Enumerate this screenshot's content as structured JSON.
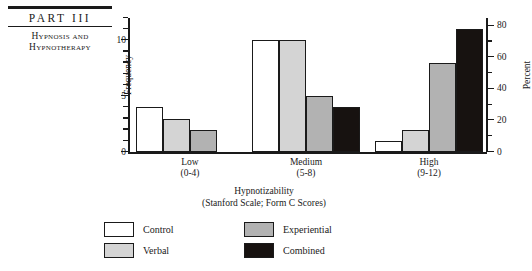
{
  "page_header": {
    "part_label": "PART III",
    "subtitle_line1": "Hypnosis and",
    "subtitle_line2": "Hypnotherapy"
  },
  "legend": {
    "items": [
      {
        "label": "Control",
        "color": "#ffffff"
      },
      {
        "label": "Experiential",
        "color": "#b2b2b2"
      },
      {
        "label": "Verbal",
        "color": "#d4d4d4"
      },
      {
        "label": "Combined",
        "color": "#171210"
      }
    ]
  },
  "chart_data": {
    "type": "bar",
    "title": "",
    "xlabel_line1": "Hypnotizability",
    "xlabel_line2": "(Stanford Scale; Form C Scores)",
    "ylabel": "Frequency",
    "ylabel_secondary": "Percent",
    "categories": [
      "Low",
      "Medium",
      "High"
    ],
    "category_sublabels": [
      "(0-4)",
      "(5-8)",
      "(9-12)"
    ],
    "series": [
      {
        "name": "Control",
        "color": "#ffffff",
        "values": [
          4,
          10,
          1
        ]
      },
      {
        "name": "Verbal",
        "color": "#d4d4d4",
        "values": [
          3,
          10,
          2
        ]
      },
      {
        "name": "Experiential",
        "color": "#b2b2b2",
        "values": [
          2,
          5,
          8
        ]
      },
      {
        "name": "Combined",
        "color": "#171210",
        "values": [
          0,
          4,
          11
        ]
      }
    ],
    "ylim": [
      0,
      12
    ],
    "yticks_major": [
      0,
      5,
      10
    ],
    "yticks_minor_step": 1,
    "ylim_secondary": [
      0,
      85
    ],
    "yticks_secondary_major": [
      0,
      20,
      40,
      60,
      80
    ],
    "yticks_secondary_minor_step": 10,
    "grid": false,
    "legend_position": "bottom"
  }
}
